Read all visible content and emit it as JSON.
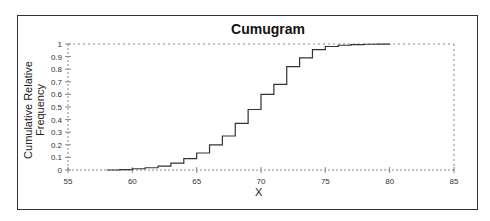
{
  "chart_data": {
    "type": "line",
    "step": true,
    "title": "Cumugram",
    "xlabel": "X",
    "ylabel": "Cumulative Relative Frequency",
    "xlim": [
      55,
      85
    ],
    "ylim": [
      0,
      1
    ],
    "x_ticks": [
      55,
      60,
      65,
      70,
      75,
      80,
      85
    ],
    "y_ticks": [
      0,
      0.1,
      0.2,
      0.3,
      0.4,
      0.5,
      0.6,
      0.7,
      0.8,
      0.9,
      1
    ],
    "y_tick_labels": [
      "0",
      "0.1",
      "0.2",
      "0.3",
      "0.4",
      "0.5",
      "0.6",
      "0.7",
      "0.8",
      "0.9",
      "1"
    ],
    "grid": false,
    "legend": null,
    "series": [
      {
        "name": "Cumulative Relative Frequency",
        "x": [
          58,
          59,
          60,
          61,
          62,
          63,
          64,
          65,
          66,
          67,
          68,
          69,
          70,
          71,
          72,
          73,
          74,
          75,
          76,
          77,
          78,
          79,
          80
        ],
        "y": [
          0.0,
          0.003,
          0.01,
          0.018,
          0.03,
          0.055,
          0.09,
          0.135,
          0.2,
          0.27,
          0.37,
          0.48,
          0.6,
          0.68,
          0.82,
          0.89,
          0.955,
          0.98,
          0.99,
          0.995,
          0.998,
          0.999,
          1.0
        ]
      }
    ]
  }
}
